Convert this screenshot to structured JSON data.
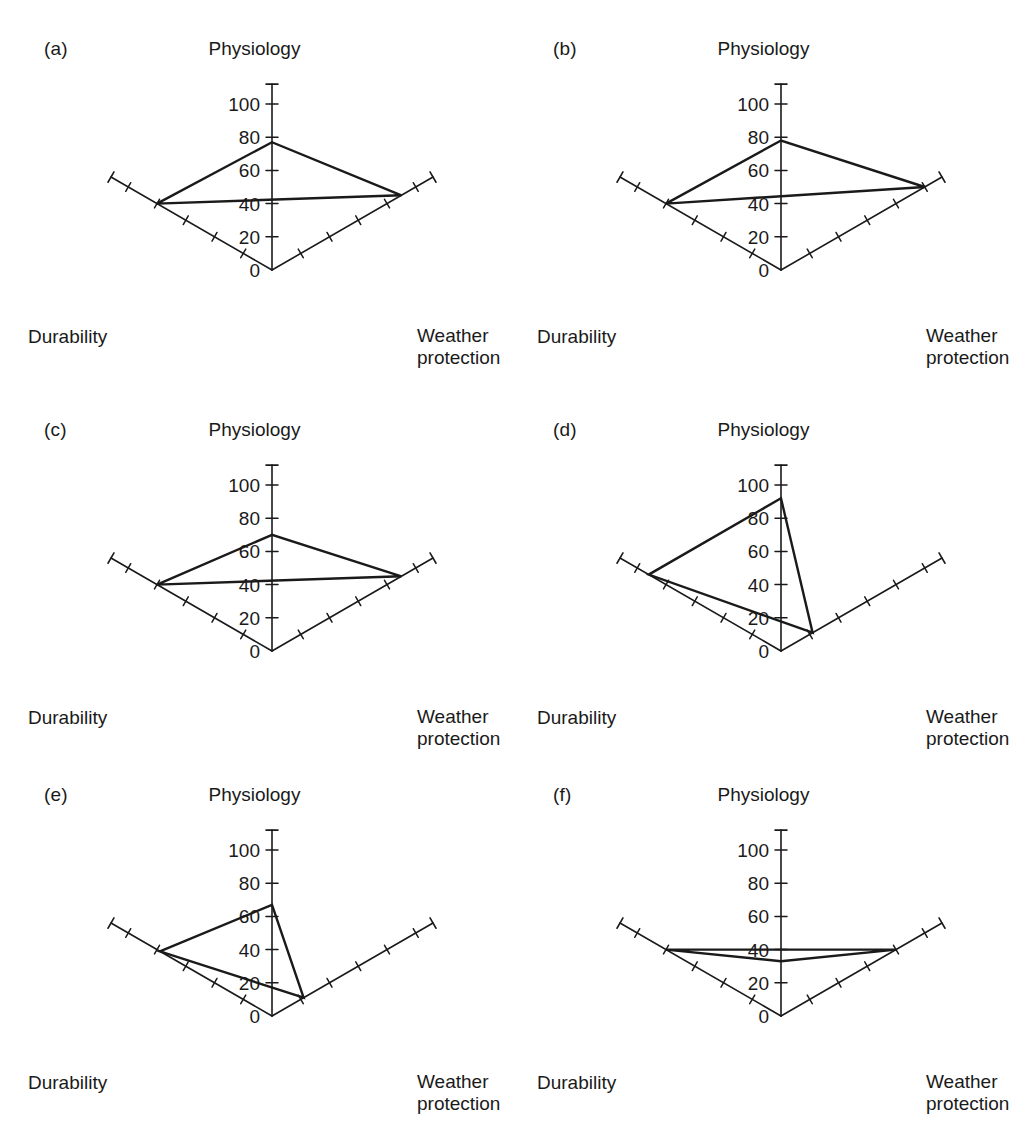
{
  "figure": {
    "background": "#ffffff",
    "stroke_color": "#1a1a1a",
    "axis_labels": {
      "top": "Physiology",
      "left": "Durability",
      "right_line1": "Weather",
      "right_line2": "protection"
    },
    "tick_labels": [
      "0",
      "20",
      "40",
      "60",
      "80",
      "100"
    ]
  },
  "panels": [
    {
      "tag": "(a)",
      "row": 0,
      "col": 0
    },
    {
      "tag": "(b)",
      "row": 0,
      "col": 1
    },
    {
      "tag": "(c)",
      "row": 1,
      "col": 0
    },
    {
      "tag": "(d)",
      "row": 1,
      "col": 1
    },
    {
      "tag": "(e)",
      "row": 2,
      "col": 0
    },
    {
      "tag": "(f)",
      "row": 2,
      "col": 1
    }
  ],
  "chart_data": [
    {
      "type": "radar",
      "title": "(a)",
      "categories": [
        "Physiology",
        "Durability",
        "Weather protection"
      ],
      "values": [
        77,
        80,
        90
      ],
      "rlim": [
        0,
        100
      ],
      "rticks": [
        0,
        20,
        40,
        60,
        80,
        100
      ],
      "grid": false,
      "legend": "none"
    },
    {
      "type": "radar",
      "title": "(b)",
      "categories": [
        "Physiology",
        "Durability",
        "Weather protection"
      ],
      "values": [
        78,
        80,
        100
      ],
      "rlim": [
        0,
        100
      ],
      "rticks": [
        0,
        20,
        40,
        60,
        80,
        100
      ],
      "grid": false,
      "legend": "none"
    },
    {
      "type": "radar",
      "title": "(c)",
      "categories": [
        "Physiology",
        "Durability",
        "Weather protection"
      ],
      "values": [
        70,
        80,
        90
      ],
      "rlim": [
        0,
        100
      ],
      "rticks": [
        0,
        20,
        40,
        60,
        80,
        100
      ],
      "grid": false,
      "legend": "none"
    },
    {
      "type": "radar",
      "title": "(d)",
      "categories": [
        "Physiology",
        "Durability",
        "Weather protection"
      ],
      "values": [
        92,
        92,
        22
      ],
      "rlim": [
        0,
        100
      ],
      "rticks": [
        0,
        20,
        40,
        60,
        80,
        100
      ],
      "grid": false,
      "legend": "none"
    },
    {
      "type": "radar",
      "title": "(e)",
      "categories": [
        "Physiology",
        "Durability",
        "Weather protection"
      ],
      "values": [
        67,
        78,
        22
      ],
      "rlim": [
        0,
        100
      ],
      "rticks": [
        0,
        20,
        40,
        60,
        80,
        100
      ],
      "grid": false,
      "legend": "none"
    },
    {
      "type": "radar",
      "title": "(f)",
      "categories": [
        "Physiology",
        "Durability",
        "Weather protection"
      ],
      "values": [
        33,
        80,
        80
      ],
      "rlim": [
        0,
        100
      ],
      "rticks": [
        0,
        20,
        40,
        60,
        80,
        100
      ],
      "grid": false,
      "legend": "none"
    }
  ]
}
